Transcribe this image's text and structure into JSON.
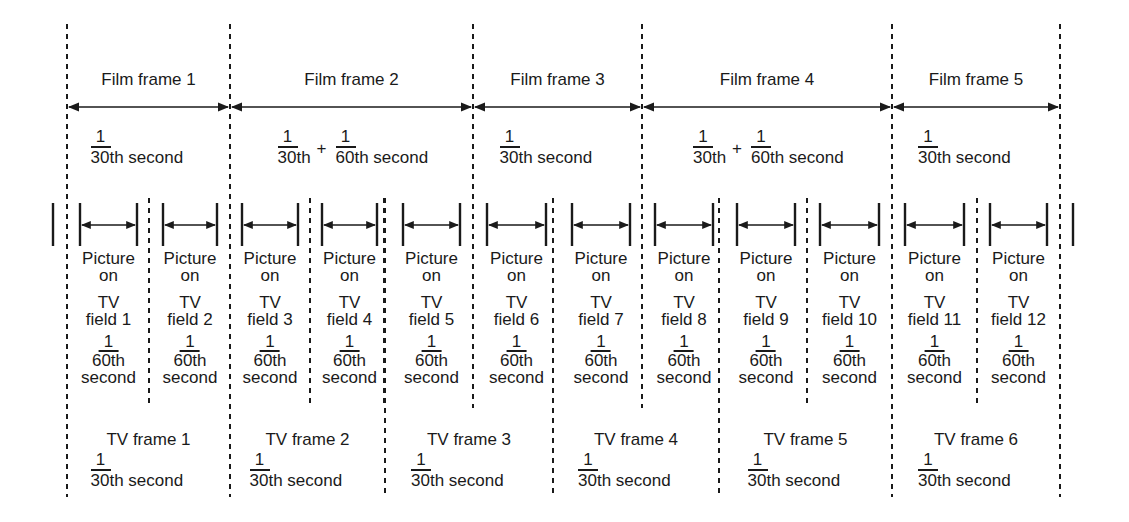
{
  "diagram": {
    "film_frames": [
      {
        "label": "Film frame 1",
        "x1": 67,
        "x2": 230,
        "duration": {
          "type": "simple",
          "num": "1",
          "den": "30th second"
        }
      },
      {
        "label": "Film frame 2",
        "x1": 230,
        "x2": 473,
        "duration": {
          "type": "sum",
          "num1": "1",
          "den1": "30th",
          "plus": "+",
          "num2": "1",
          "den2": "60th second"
        }
      },
      {
        "label": "Film frame 3",
        "x1": 473,
        "x2": 642,
        "duration": {
          "type": "simple",
          "num": "1",
          "den": "30th second"
        }
      },
      {
        "label": "Film frame 4",
        "x1": 642,
        "x2": 892,
        "duration": {
          "type": "sum",
          "num1": "1",
          "den1": "30th",
          "plus": "+",
          "num2": "1",
          "den2": "60th second"
        }
      },
      {
        "label": "Film frame 5",
        "x1": 892,
        "x2": 1060,
        "duration": {
          "type": "simple",
          "num": "1",
          "den": "30th second"
        }
      }
    ],
    "tv_fields": [
      {
        "name": "TV",
        "field": "field 1",
        "bar": [
          80,
          137
        ],
        "picture": "Picture",
        "on": "on",
        "num": "1",
        "den1": "60th",
        "den2": "second"
      },
      {
        "name": "TV",
        "field": "field 2",
        "bar": [
          163,
          217
        ],
        "picture": "Picture",
        "on": "on",
        "num": "1",
        "den1": "60th",
        "den2": "second"
      },
      {
        "name": "TV",
        "field": "field 3",
        "bar": [
          242,
          298
        ],
        "picture": "Picture",
        "on": "on",
        "num": "1",
        "den1": "60th",
        "den2": "second"
      },
      {
        "name": "TV",
        "field": "field 4",
        "bar": [
          322,
          377
        ],
        "picture": "Picture",
        "on": "on",
        "num": "1",
        "den1": "60th",
        "den2": "second"
      },
      {
        "name": "TV",
        "field": "field 5",
        "bar": [
          403,
          460
        ],
        "picture": "Picture",
        "on": "on",
        "num": "1",
        "den1": "60th",
        "den2": "second"
      },
      {
        "name": "TV",
        "field": "field 6",
        "bar": [
          487,
          546
        ],
        "picture": "Picture",
        "on": "on",
        "num": "1",
        "den1": "60th",
        "den2": "second"
      },
      {
        "name": "TV",
        "field": "field 7",
        "bar": [
          572,
          630
        ],
        "picture": "Picture",
        "on": "on",
        "num": "1",
        "den1": "60th",
        "den2": "second"
      },
      {
        "name": "TV",
        "field": "field 8",
        "bar": [
          655,
          713
        ],
        "picture": "Picture",
        "on": "on",
        "num": "1",
        "den1": "60th",
        "den2": "second"
      },
      {
        "name": "TV",
        "field": "field 9",
        "bar": [
          737,
          795
        ],
        "picture": "Picture",
        "on": "on",
        "num": "1",
        "den1": "60th",
        "den2": "second"
      },
      {
        "name": "TV",
        "field": "field 10",
        "bar": [
          820,
          879
        ],
        "picture": "Picture",
        "on": "on",
        "num": "1",
        "den1": "60th",
        "den2": "second"
      },
      {
        "name": "TV",
        "field": "field 11",
        "bar": [
          905,
          964
        ],
        "picture": "Picture",
        "on": "on",
        "num": "1",
        "den1": "60th",
        "den2": "second"
      },
      {
        "name": "TV",
        "field": "field 12",
        "bar": [
          990,
          1047
        ],
        "picture": "Picture",
        "on": "on",
        "num": "1",
        "den1": "60th",
        "den2": "second"
      }
    ],
    "field_dividers": [
      149,
      310,
      384,
      553,
      719,
      807,
      977
    ],
    "tv_frame_dividers": [
      385,
      553,
      719
    ],
    "edge_bars": [
      53,
      1073
    ],
    "tv_frames": [
      {
        "label": "TV frame 1",
        "x1": 67,
        "x2": 230,
        "num": "1",
        "den": "30th second"
      },
      {
        "label": "TV frame 2",
        "x1": 230,
        "x2": 385,
        "num": "1",
        "den": "30th second"
      },
      {
        "label": "TV frame 3",
        "x1": 385,
        "x2": 553,
        "num": "1",
        "den": "30th second"
      },
      {
        "label": "TV frame 4",
        "x1": 553,
        "x2": 719,
        "num": "1",
        "den": "30th second"
      },
      {
        "label": "TV frame 5",
        "x1": 719,
        "x2": 892,
        "num": "1",
        "den": "30th second"
      },
      {
        "label": "TV frame 6",
        "x1": 892,
        "x2": 1060,
        "num": "1",
        "den": "30th second"
      }
    ],
    "colors": {
      "ink": "#1a1a1a",
      "background": "#ffffff"
    }
  }
}
